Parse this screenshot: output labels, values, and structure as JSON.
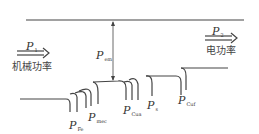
{
  "diagram": {
    "type": "power-flow",
    "input": {
      "symbol": "P",
      "sub": "1",
      "label": "机械功率"
    },
    "output": {
      "symbol": "P",
      "sub": "2",
      "label": "电功率"
    },
    "em": {
      "symbol": "P",
      "sub": "em"
    },
    "losses": [
      {
        "symbol": "P",
        "sub": "Fe"
      },
      {
        "symbol": "P",
        "sub": "mec"
      },
      {
        "symbol": "P",
        "sub": "Cua"
      },
      {
        "symbol": "P",
        "sub": "s"
      },
      {
        "symbol": "P",
        "sub": "Cuf"
      }
    ],
    "colors": {
      "line": "#444444",
      "text": "#333333"
    }
  }
}
